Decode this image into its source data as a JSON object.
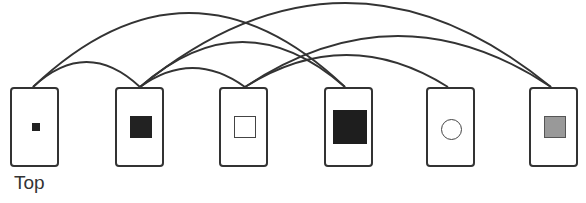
{
  "diagram": {
    "label": "Top",
    "stroke_color": "#333333",
    "cards": [
      {
        "id": 1,
        "x": 10,
        "y": 87,
        "symbol": "small-filled-square",
        "sym_size": 8,
        "fill": "#222222",
        "anchor": [
          33,
          87
        ]
      },
      {
        "id": 2,
        "x": 115,
        "y": 87,
        "symbol": "filled-square",
        "sym_size": 22,
        "fill": "#222222",
        "anchor": [
          140,
          87
        ]
      },
      {
        "id": 3,
        "x": 219,
        "y": 87,
        "symbol": "hollow-square",
        "sym_size": 22,
        "fill": "#ffffff",
        "anchor": [
          245,
          87
        ]
      },
      {
        "id": 4,
        "x": 324,
        "y": 87,
        "symbol": "large-filled-square",
        "sym_size": 34,
        "fill": "#1e1e1e",
        "anchor": [
          345,
          87
        ]
      },
      {
        "id": 5,
        "x": 426,
        "y": 87,
        "symbol": "hollow-circle",
        "sym_size": 21,
        "fill": "#ffffff",
        "anchor": [
          448,
          87
        ]
      },
      {
        "id": 6,
        "x": 529,
        "y": 87,
        "symbol": "gray-square",
        "sym_size": 22,
        "fill": "#999999",
        "anchor": [
          551,
          87
        ]
      }
    ],
    "edges": [
      {
        "from": 1,
        "to": 2,
        "peak": 62
      },
      {
        "from": 1,
        "to": 4,
        "peak": 13
      },
      {
        "from": 2,
        "to": 3,
        "peak": 68
      },
      {
        "from": 2,
        "to": 4,
        "peak": 42
      },
      {
        "from": 2,
        "to": 6,
        "peak": 3
      },
      {
        "from": 3,
        "to": 5,
        "peak": 55
      },
      {
        "from": 3,
        "to": 6,
        "peak": 36
      }
    ]
  }
}
